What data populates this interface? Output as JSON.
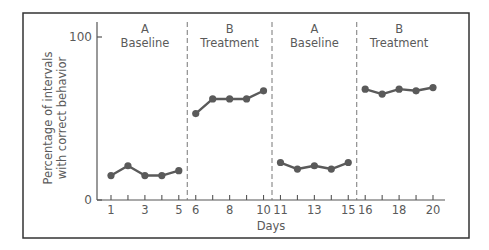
{
  "chart_data": {
    "type": "line",
    "title": "",
    "xlabel": "Days",
    "ylabel": "Percentage of intervals with correct behavior",
    "ylabel_lines": [
      "Percentage of intervals",
      "with correct behavior"
    ],
    "xlim": [
      0,
      21
    ],
    "ylim": [
      0,
      100
    ],
    "y_ticks": [
      0,
      100
    ],
    "x_ticks": [
      1,
      2,
      3,
      4,
      5,
      6,
      7,
      8,
      9,
      10,
      11,
      12,
      13,
      14,
      15,
      16,
      17,
      18,
      19,
      20
    ],
    "x_tick_labels": [
      "1",
      "3",
      "5",
      "6",
      "8",
      "10",
      "11",
      "13",
      "15",
      "16",
      "18",
      "20"
    ],
    "x_tick_label_positions": [
      1,
      3,
      5,
      6,
      8,
      10,
      11,
      13,
      15,
      16,
      18,
      20
    ],
    "grid": false,
    "legend": null,
    "phase_dividers": [
      5.5,
      10.5,
      15.5
    ],
    "phases": [
      {
        "letter": "A",
        "name": "Baseline",
        "x": [
          1,
          2,
          3,
          4,
          5
        ],
        "values": [
          15,
          21,
          15,
          15,
          18
        ]
      },
      {
        "letter": "B",
        "name": "Treatment",
        "x": [
          6,
          7,
          8,
          9,
          10
        ],
        "values": [
          53,
          62,
          62,
          62,
          67
        ]
      },
      {
        "letter": "A",
        "name": "Baseline",
        "x": [
          11,
          12,
          13,
          14,
          15
        ],
        "values": [
          23,
          19,
          21,
          19,
          23
        ]
      },
      {
        "letter": "B",
        "name": "Treatment",
        "x": [
          16,
          17,
          18,
          19,
          20
        ],
        "values": [
          68,
          65,
          68,
          67,
          69
        ]
      }
    ],
    "colors": {
      "line": "#5a5a5a",
      "axis": "#555555",
      "frame": "#333333",
      "divider": "#777777"
    }
  }
}
